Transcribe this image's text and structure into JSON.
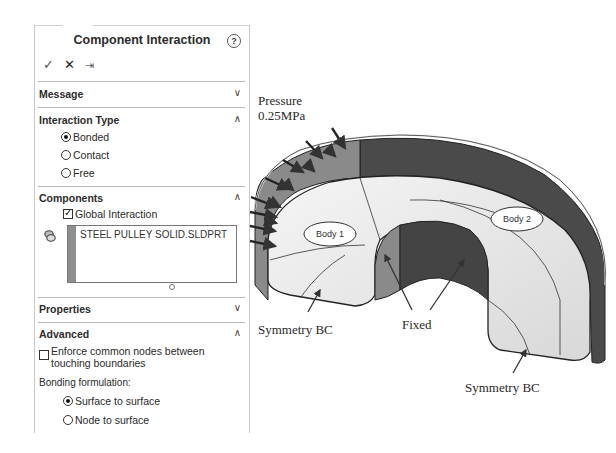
{
  "panel": {
    "title": "Component Interaction",
    "help_icon": "question-circle-icon",
    "actions": {
      "ok": "✓",
      "cancel": "✕",
      "pin": "⇥"
    },
    "sections": {
      "message": {
        "label": "Message",
        "state": "collapsed",
        "chevron": "∨"
      },
      "interaction_type": {
        "label": "Interaction Type",
        "state": "expanded",
        "chevron": "∧",
        "options": [
          {
            "label": "Bonded",
            "selected": true
          },
          {
            "label": "Contact",
            "selected": false
          },
          {
            "label": "Free",
            "selected": false
          }
        ]
      },
      "components": {
        "label": "Components",
        "state": "expanded",
        "chevron": "∧",
        "global_interaction": {
          "label": "Global Interaction",
          "checked": true
        },
        "list_items": [
          "STEEL PULLEY SOLID.SLDPRT"
        ]
      },
      "properties": {
        "label": "Properties",
        "state": "collapsed",
        "chevron": "∨"
      },
      "advanced": {
        "label": "Advanced",
        "state": "expanded",
        "chevron": "∧",
        "enforce_common_nodes": {
          "label_line1": "Enforce common nodes between",
          "label_line2": "touching boundaries",
          "checked": false
        },
        "bonding_formulation_label": "Bonding formulation:",
        "bonding_options": [
          {
            "label": "Surface to surface",
            "selected": true
          },
          {
            "label": "Node to surface",
            "selected": false
          }
        ]
      }
    }
  },
  "figure": {
    "pressure_label_line1": "Pressure",
    "pressure_label_line2": "0.25MPa",
    "body1_label": "Body 1",
    "body2_label": "Body 2",
    "fixed_label": "Fixed",
    "symmetry_left_label": "Symmetry BC",
    "symmetry_right_label": "Symmetry BC"
  }
}
